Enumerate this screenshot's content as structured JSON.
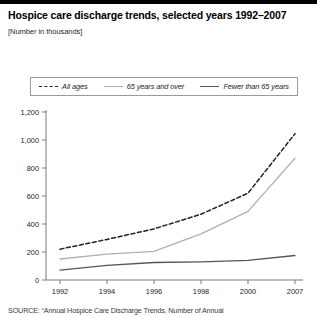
{
  "header": {
    "title": "Hospice care discharge trends, selected years 1992–2007",
    "subtitle": "[Number in thousands]"
  },
  "legend": {
    "items": [
      {
        "label": "All ages",
        "style": "dashed",
        "color": "#222222"
      },
      {
        "label": "65 years and over",
        "style": "gray",
        "color": "#b0b0b0"
      },
      {
        "label": "Fewer than 65 years",
        "style": "dark",
        "color": "#555555"
      }
    ]
  },
  "source": {
    "text": "SOURCE: “Annual Hospice Care Discharge Trends, Number of Annual"
  },
  "chart_data": {
    "type": "line",
    "title": "Hospice care discharge trends, selected years 1992–2007",
    "subtitle": "[Number in thousands]",
    "xlabel": "",
    "ylabel": "",
    "categories": [
      "1992",
      "1994",
      "1996",
      "1998",
      "2000",
      "2007"
    ],
    "ytick_labels": [
      "0",
      "200",
      "400",
      "600",
      "800",
      "1,000",
      "1,200"
    ],
    "yticks": [
      0,
      200,
      400,
      600,
      800,
      1000,
      1200
    ],
    "ylim": [
      0,
      1200
    ],
    "grid": false,
    "legend_position": "top",
    "series": [
      {
        "name": "All ages",
        "style": "dashed",
        "color": "#222222",
        "values": [
          220,
          290,
          365,
          470,
          620,
          1045
        ]
      },
      {
        "name": "65 years and over",
        "style": "solid",
        "color": "#b0b0b0",
        "values": [
          150,
          185,
          205,
          330,
          490,
          870
        ]
      },
      {
        "name": "Fewer than 65 years",
        "style": "solid",
        "color": "#555555",
        "values": [
          70,
          105,
          125,
          130,
          140,
          175
        ]
      }
    ]
  }
}
